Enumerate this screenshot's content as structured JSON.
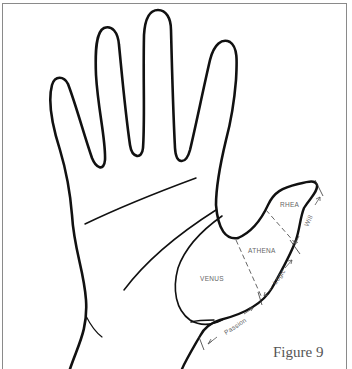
{
  "figure": {
    "caption": "Figure 9"
  },
  "regions": {
    "venus": "VENUS",
    "athena": "ATHENA",
    "rhea": "RHEA"
  },
  "phalanges": {
    "passion": "Passion",
    "logic": "Logic",
    "will": "Will"
  },
  "colors": {
    "line": "#111111",
    "label": "#666666",
    "frame": "#8a8a8a"
  }
}
